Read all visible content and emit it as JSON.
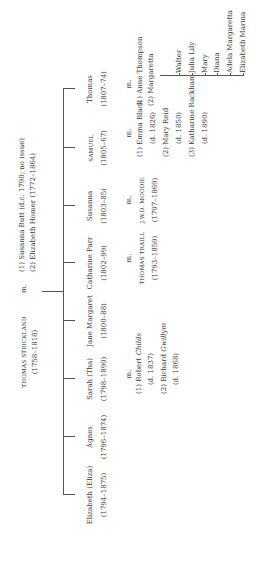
{
  "patriarch": {
    "name": "THOMAS STRICKLAND",
    "dates": "(1758–1818)",
    "marriage_marker": "m.",
    "spouses": [
      {
        "label": "(1) Susanna Butt (d.c. 1790; no issue)"
      },
      {
        "label": "(2) Elizabeth Homer (1772–1864)"
      }
    ]
  },
  "children": [
    {
      "name": "Elizabeth (Eliza)",
      "dates": "(1794–1875)"
    },
    {
      "name": "Agnes",
      "dates": "(1796–1874)"
    },
    {
      "name": "Sarah (Tha)",
      "dates": "(1798–1890)",
      "marriage_marker": "m.",
      "spouses": [
        {
          "label": "(1) Robert Childs",
          "note": "(d. 1837)"
        },
        {
          "label": "(2) Richard Gwillym",
          "note": "(d. 1868)"
        }
      ]
    },
    {
      "name": "Jane Margaret",
      "dates": "(1800–88)"
    },
    {
      "name": "Catharine Parr",
      "dates": "(1802–99)",
      "marriage_marker": "m.",
      "spouses": [
        {
          "label": "THOMAS TRAILL",
          "note": "(1793–1859)"
        }
      ]
    },
    {
      "name": "Susanna",
      "dates": "(1803–85)",
      "marriage_marker": "m.",
      "spouses": [
        {
          "label": "J.W.D. MOODIE",
          "note": "(1797–1869)"
        }
      ]
    },
    {
      "name": "SAMUEL",
      "dates": "(1805–67)",
      "marriage_marker": "m.",
      "spouses": [
        {
          "label": "(1) Emma Black",
          "note": "(d. 1826)"
        },
        {
          "label": "(2) Mary Reid",
          "note": "(d. 1850)"
        },
        {
          "label": "(3) Katharine Rackham",
          "note": "(d. 1890)"
        }
      ]
    },
    {
      "name": "Thomas",
      "dates": "(1807–74)",
      "marriage_marker": "m.",
      "spouses": [
        {
          "label": "(1) Anne Thompson"
        },
        {
          "label": "(2) Margaretta"
        }
      ],
      "children": [
        "Walter",
        "Julia Lily",
        "Mary",
        "Diana",
        "Adela Margaretta",
        "Elizabeth Marina"
      ]
    }
  ]
}
